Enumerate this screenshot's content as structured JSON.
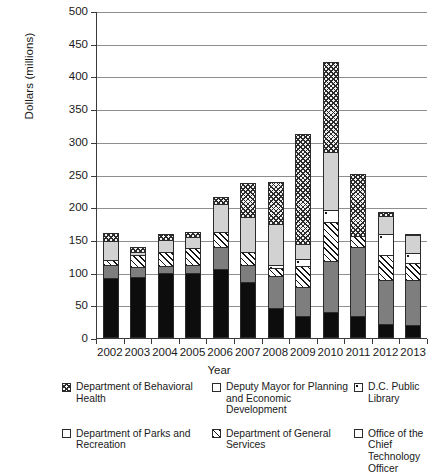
{
  "chart_data": {
    "type": "bar",
    "stacked": true,
    "title": "",
    "xlabel": "Year",
    "ylabel": "Dollars (millions)",
    "ylim": [
      0,
      500
    ],
    "yticks": [
      0,
      50,
      100,
      150,
      200,
      250,
      300,
      350,
      400,
      450,
      500
    ],
    "grid": true,
    "legend_position": "bottom",
    "categories": [
      "2002",
      "2003",
      "2004",
      "2005",
      "2006",
      "2007",
      "2008",
      "2009",
      "2010",
      "2011",
      "2012",
      "2013"
    ],
    "series": [
      {
        "name": "Office of the Chief Technology Officer",
        "pattern": "solid-black",
        "values": [
          92,
          93,
          100,
          100,
          105,
          86,
          46,
          33,
          40,
          34,
          22,
          20
        ]
      },
      {
        "name": "Department of Parks and Recreation",
        "pattern": "solid-gray",
        "values": [
          21,
          17,
          12,
          13,
          35,
          27,
          51,
          47,
          80,
          106,
          68,
          70
        ]
      },
      {
        "name": "Department of General Services",
        "pattern": "diagonal-hatch",
        "values": [
          10,
          20,
          22,
          27,
          25,
          22,
          13,
          33,
          60,
          19,
          40,
          28
        ]
      },
      {
        "name": "D.C. Public Library",
        "pattern": "dotted",
        "values": [
          0,
          0,
          0,
          0,
          0,
          0,
          7,
          12,
          20,
          0,
          33,
          17
        ]
      },
      {
        "name": "Deputy Mayor for Planning and Economic Development",
        "pattern": "light-gray",
        "values": [
          30,
          6,
          21,
          19,
          45,
          55,
          63,
          25,
          90,
          0,
          29,
          28
        ]
      },
      {
        "name": "Department of Behavioral Health",
        "pattern": "cross-hatch",
        "values": [
          13,
          9,
          10,
          10,
          12,
          53,
          67,
          170,
          140,
          96,
          8,
          4
        ]
      }
    ],
    "totals": [
      166,
      145,
      165,
      169,
      222,
      243,
      247,
      320,
      430,
      255,
      200,
      167
    ]
  },
  "legend": {
    "items": [
      {
        "label": "Department of Behavioral Health",
        "pattern": "cross-hatch"
      },
      {
        "label": "Deputy Mayor for Planning and Economic Development",
        "pattern": "light-gray"
      },
      {
        "label": "D.C. Public Library",
        "pattern": "dotted"
      },
      {
        "label": "Department of Parks and Recreation",
        "pattern": "solid-gray"
      },
      {
        "label": "Department of General Services",
        "pattern": "diagonal-hatch"
      },
      {
        "label": "Office of the Chief Technology Officer",
        "pattern": "solid-black"
      }
    ]
  }
}
